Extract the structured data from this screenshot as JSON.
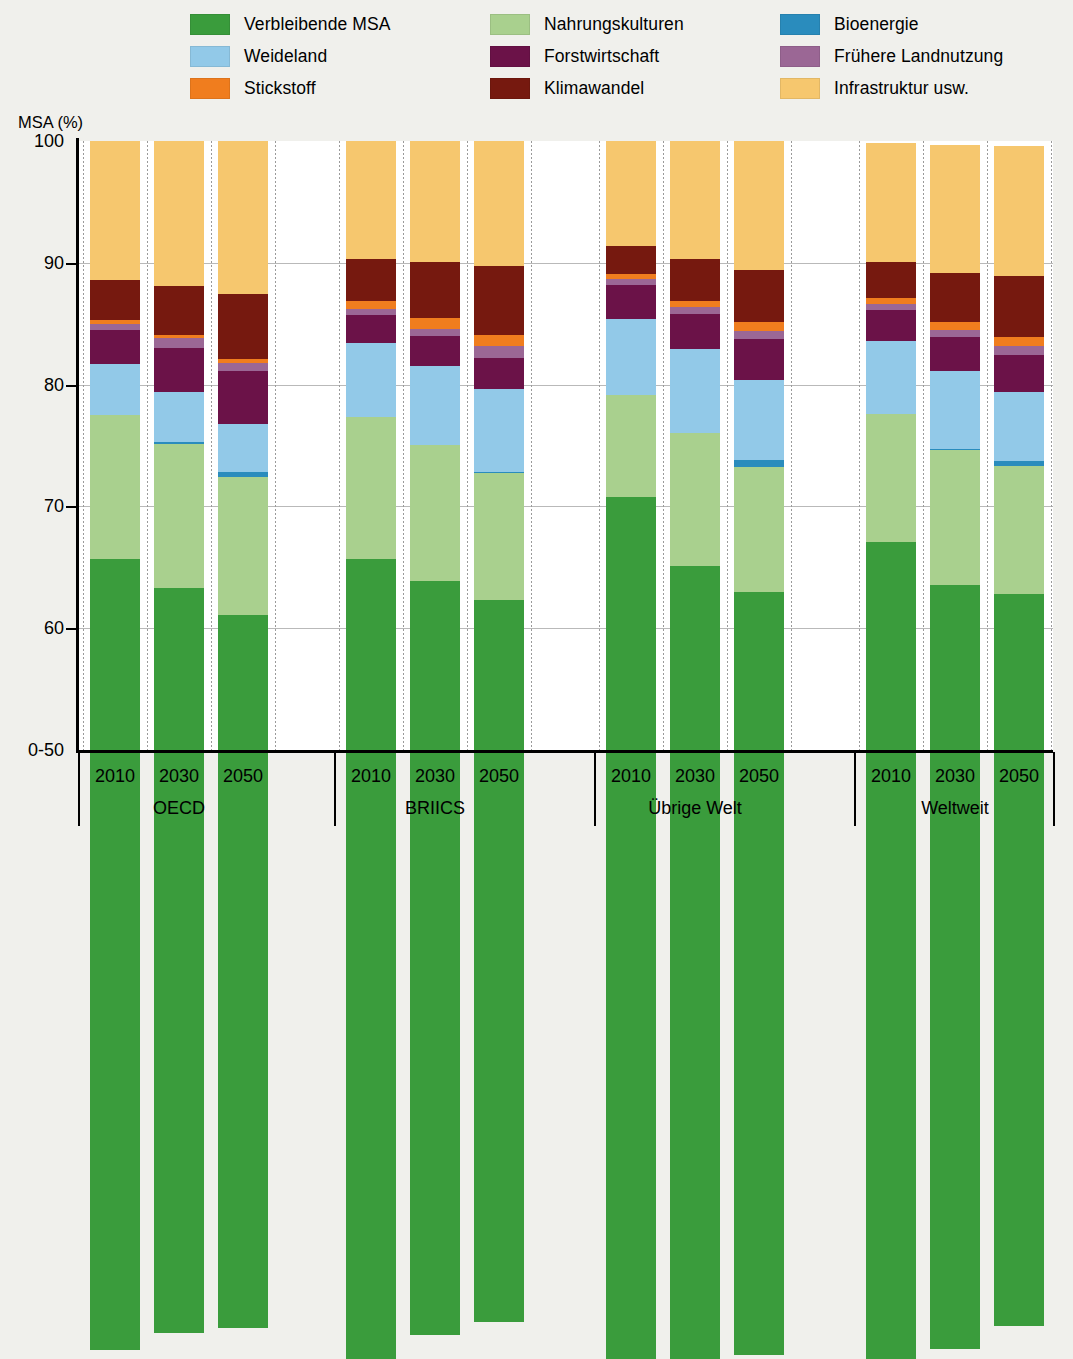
{
  "axis": {
    "y_title": "MSA (%)",
    "y_ticks": [
      "100",
      "90",
      "80",
      "70",
      "60",
      "0-50"
    ],
    "y_tick_values": [
      100,
      90,
      80,
      70,
      60,
      50
    ],
    "ylim": [
      50,
      100
    ]
  },
  "legend": {
    "items": [
      {
        "label": "Verbleibende MSA",
        "color": "#3a9c3c",
        "key": "verbleibende_msa"
      },
      {
        "label": "Nahrungskulturen",
        "color": "#a9d08e",
        "key": "nahrungskulturen"
      },
      {
        "label": "Bioenergie",
        "color": "#2a8cbd",
        "key": "bioenergie"
      },
      {
        "label": "Weideland",
        "color": "#92c9e8",
        "key": "weideland"
      },
      {
        "label": "Forstwirtschaft",
        "color": "#6b1248",
        "key": "forstwirtschaft"
      },
      {
        "label": "Frühere Landnutzung",
        "color": "#9b6795",
        "key": "fruehere_landnutzung"
      },
      {
        "label": "Stickstoff",
        "color": "#f07d1e",
        "key": "stickstoff"
      },
      {
        "label": "Klimawandel",
        "color": "#76190f",
        "key": "klimawandel"
      },
      {
        "label": "Infrastruktur usw.",
        "color": "#f6c76e",
        "key": "infrastruktur"
      }
    ]
  },
  "groups": [
    {
      "name": "OECD",
      "years": [
        "2010",
        "2030",
        "2050"
      ]
    },
    {
      "name": "BRIICS",
      "years": [
        "2010",
        "2030",
        "2050"
      ]
    },
    {
      "name": "Übrige Welt",
      "years": [
        "2010",
        "2030",
        "2050"
      ]
    },
    {
      "name": "Weltweit",
      "years": [
        "2010",
        "2030",
        "2050"
      ]
    }
  ],
  "chart_data": {
    "type": "bar",
    "stacked": true,
    "title": "",
    "xlabel": "",
    "ylabel": "MSA (%)",
    "ylim": [
      50,
      100
    ],
    "grid": true,
    "legend_position": "top",
    "categories": [
      "OECD 2010",
      "OECD 2030",
      "OECD 2050",
      "BRIICS 2010",
      "BRIICS 2030",
      "BRIICS 2050",
      "Übrige Welt 2010",
      "Übrige Welt 2030",
      "Übrige Welt 2050",
      "Weltweit 2010",
      "Weltweit 2030",
      "Weltweit 2050"
    ],
    "series": [
      {
        "name": "Verbleibende MSA",
        "color": "#3a9c3c",
        "values": [
          65.0,
          61.2,
          58.6,
          65.7,
          61.9,
          59.3,
          70.8,
          65.1,
          62.7,
          67.1,
          62.7,
          60.1
        ]
      },
      {
        "name": "Nahrungskulturen",
        "color": "#a9d08e",
        "values": [
          11.8,
          11.8,
          11.3,
          11.6,
          11.1,
          10.4,
          8.3,
          10.9,
          10.2,
          10.5,
          11.1,
          10.5
        ]
      },
      {
        "name": "Bioenergie",
        "color": "#2a8cbd",
        "values": [
          0.0,
          0.2,
          0.4,
          0.0,
          0.0,
          0.1,
          0.0,
          0.0,
          0.6,
          0.0,
          0.1,
          0.4
        ]
      },
      {
        "name": "Weideland",
        "color": "#92c9e8",
        "values": [
          4.2,
          4.1,
          4.0,
          6.1,
          6.5,
          6.8,
          6.3,
          6.9,
          6.6,
          6.0,
          6.4,
          5.7
        ]
      },
      {
        "name": "Forstwirtschaft",
        "color": "#6b1248",
        "values": [
          2.8,
          3.6,
          4.3,
          2.3,
          2.5,
          2.6,
          2.8,
          2.9,
          3.3,
          2.5,
          2.8,
          3.0
        ]
      },
      {
        "name": "Frühere Landnutzung",
        "color": "#9b6795",
        "values": [
          0.5,
          0.8,
          0.7,
          0.5,
          0.6,
          1.0,
          0.5,
          0.6,
          0.7,
          0.5,
          0.6,
          0.8
        ]
      },
      {
        "name": "Stickstoff",
        "color": "#f07d1e",
        "values": [
          0.3,
          0.3,
          0.3,
          0.7,
          0.9,
          0.9,
          0.4,
          0.5,
          0.7,
          0.5,
          0.6,
          0.7
        ]
      },
      {
        "name": "Klimawandel",
        "color": "#76190f",
        "values": [
          3.3,
          4.0,
          5.3,
          3.4,
          4.6,
          5.6,
          2.3,
          3.4,
          4.3,
          3.0,
          4.1,
          5.0
        ]
      },
      {
        "name": "Infrastruktur usw.",
        "color": "#f6c76e",
        "values": [
          11.4,
          11.9,
          12.6,
          9.7,
          9.9,
          10.3,
          8.6,
          9.7,
          10.6,
          9.7,
          10.5,
          10.7
        ]
      }
    ],
    "bar_totals": [
      100.0,
      100.0,
      100.0,
      100.0,
      100.0,
      100.0,
      100.0,
      100.0,
      100.0,
      99.8,
      99.7,
      99.6
    ]
  }
}
